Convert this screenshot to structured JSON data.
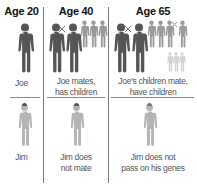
{
  "columns": [
    {
      "header": "Age 20",
      "top_label": "Joe",
      "bottom_label": "Jim"
    },
    {
      "header": "Age 40",
      "top_label_lines": [
        "Joe mates,",
        "has children"
      ],
      "bottom_label_lines": [
        "Jim does",
        "not mate"
      ]
    },
    {
      "header": "Age 65",
      "top_label_lines": [
        "Joe's children mate,",
        "have children"
      ],
      "bottom_label_lines": [
        "Jim does not",
        "pass on his genes"
      ]
    }
  ],
  "colors": {
    "adult": "#555555",
    "child": "#9a9a9a",
    "grandchild": "#d2d2d2",
    "jim": "#b4b4b4",
    "divider": "#808080"
  },
  "icons": {
    "figure": "person-silhouette-icon",
    "mate_marker": "cross-icon"
  }
}
